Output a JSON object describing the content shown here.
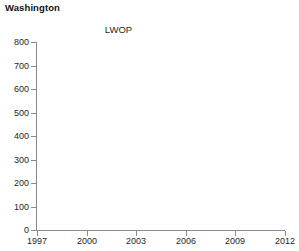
{
  "panel": {
    "title": "Washington",
    "series_label": "LWOP"
  },
  "chart_data": {
    "type": "line",
    "title": "Washington",
    "subtitle": "LWOP",
    "xlabel": "",
    "ylabel": "",
    "xlim": [
      1997,
      2012
    ],
    "ylim": [
      0,
      800
    ],
    "grid": false,
    "legend": "none",
    "x_ticks": [
      1997,
      2000,
      2003,
      2006,
      2009,
      2012
    ],
    "x_tick_labels": [
      "1997",
      "2000",
      "2003",
      "2006",
      "2009",
      "2012"
    ],
    "y_ticks": [
      0,
      100,
      200,
      300,
      400,
      500,
      600,
      700,
      800
    ],
    "y_tick_labels": [
      "0",
      "100",
      "200",
      "300",
      "400",
      "500",
      "600",
      "700",
      "800"
    ],
    "series": [
      {
        "name": "LWOP",
        "x": [],
        "values": []
      }
    ],
    "note": "Plot frame is empty - no data points are drawn in the plotting region."
  },
  "colors": {
    "axis": "#8a8a8a",
    "text": "#1f1f1f",
    "title": "#111111",
    "background": "#ffffff"
  }
}
